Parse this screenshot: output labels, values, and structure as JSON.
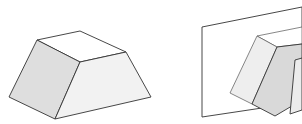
{
  "figures": [
    {
      "name": "frustum-solid",
      "description": "Truncated wedge / prismatoid solid",
      "faces": {
        "top": {
          "points": "37,40 80,31 126,52 80,62",
          "fill": "#ffffff"
        },
        "left": {
          "points": "37,40 80,62 55,119 9,97",
          "fill": "#dedede"
        },
        "front": {
          "points": "80,62 126,52 151,97 55,119",
          "fill": "#f2f2f2"
        }
      }
    },
    {
      "name": "plane-with-prism",
      "description": "Prism intersecting a vertical plane",
      "plane": {
        "points": "202,27 302,7 302,102 202,117",
        "fill": "#ffffff"
      },
      "faces": {
        "top": {
          "points": "257,36 302,27 302,44 277,47",
          "fill": "#ffffff"
        },
        "left": {
          "points": "257,36 277,47 252,104 230,93",
          "fill": "#eeeeee"
        },
        "middle": {
          "points": "277,47 302,44 302,100 275,116 252,104",
          "fill": "#d9d9d9"
        },
        "right": {
          "points": "295,60 302,58 302,110 290,114",
          "fill": "#ececec"
        }
      }
    }
  ],
  "colors": {
    "stroke": "#333333",
    "background": "#ffffff"
  }
}
